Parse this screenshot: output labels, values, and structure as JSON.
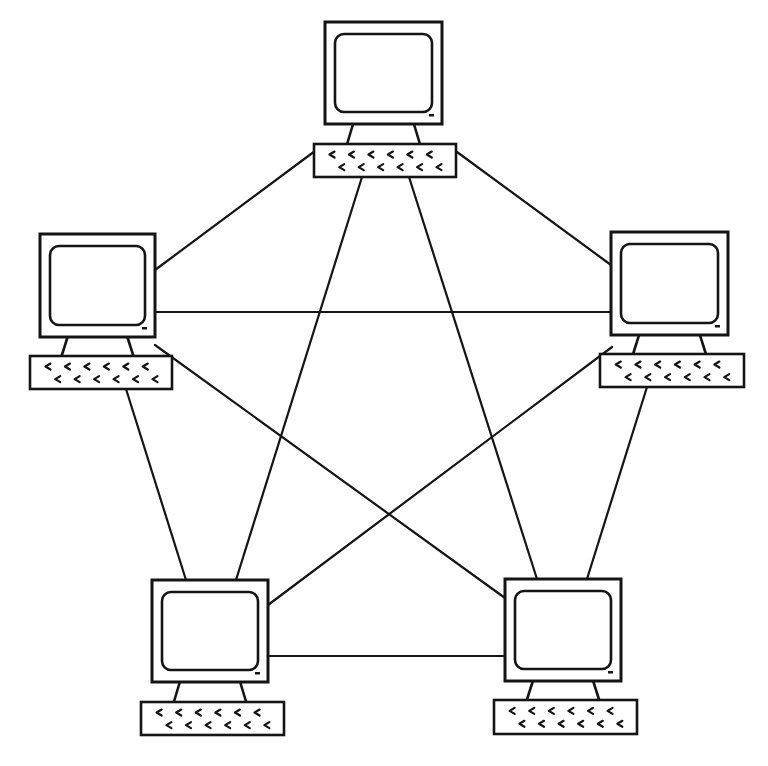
{
  "diagram": {
    "topology": "full-mesh",
    "colors": {
      "stroke": "#141414",
      "background": "#ffffff"
    },
    "nodes": [
      {
        "id": "top",
        "label": "Computer (top)",
        "monitor": {
          "x": 325,
          "y": 22,
          "w": 117,
          "h": 102
        },
        "keyboard": {
          "x": 314,
          "y": 144,
          "w": 142,
          "h": 33
        }
      },
      {
        "id": "left",
        "label": "Computer (left)",
        "monitor": {
          "x": 40,
          "y": 234,
          "w": 115,
          "h": 103
        },
        "keyboard": {
          "x": 30,
          "y": 356,
          "w": 142,
          "h": 33
        }
      },
      {
        "id": "right",
        "label": "Computer (right)",
        "monitor": {
          "x": 611,
          "y": 232,
          "w": 117,
          "h": 103
        },
        "keyboard": {
          "x": 600,
          "y": 354,
          "w": 144,
          "h": 33
        }
      },
      {
        "id": "bottom-left",
        "label": "Computer (bottom-left)",
        "monitor": {
          "x": 152,
          "y": 580,
          "w": 116,
          "h": 102
        },
        "keyboard": {
          "x": 141,
          "y": 702,
          "w": 143,
          "h": 33
        }
      },
      {
        "id": "bottom-right",
        "label": "Computer (bottom-right)",
        "monitor": {
          "x": 505,
          "y": 579,
          "w": 116,
          "h": 102
        },
        "keyboard": {
          "x": 494,
          "y": 700,
          "w": 143,
          "h": 34
        }
      }
    ],
    "links": [
      {
        "from": "left",
        "to": "top",
        "x1": 155,
        "y1": 270,
        "x2": 315,
        "y2": 151
      },
      {
        "from": "top",
        "to": "right",
        "x1": 457,
        "y1": 152,
        "x2": 611,
        "y2": 265
      },
      {
        "from": "left",
        "to": "right",
        "x1": 155,
        "y1": 312,
        "x2": 611,
        "y2": 312
      },
      {
        "from": "top",
        "to": "bottom-left",
        "x1": 362,
        "y1": 177,
        "x2": 236,
        "y2": 580
      },
      {
        "from": "top",
        "to": "bottom-right",
        "x1": 409,
        "y1": 177,
        "x2": 537,
        "y2": 579
      },
      {
        "from": "left",
        "to": "bottom-left",
        "x1": 126,
        "y1": 389,
        "x2": 186,
        "y2": 580
      },
      {
        "from": "left",
        "to": "bottom-right",
        "x1": 155,
        "y1": 345,
        "x2": 505,
        "y2": 598
      },
      {
        "from": "right",
        "to": "bottom-left",
        "x1": 612,
        "y1": 347,
        "x2": 268,
        "y2": 605
      },
      {
        "from": "right",
        "to": "bottom-right",
        "x1": 647,
        "y1": 387,
        "x2": 587,
        "y2": 579
      },
      {
        "from": "bottom-left",
        "to": "bottom-right",
        "x1": 268,
        "y1": 656,
        "x2": 505,
        "y2": 656
      }
    ]
  }
}
